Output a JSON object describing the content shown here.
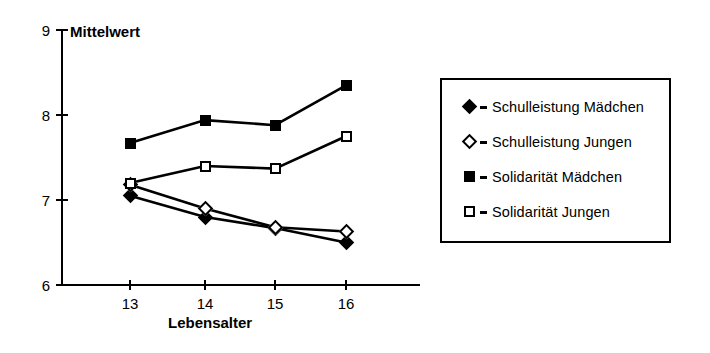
{
  "chart_data": {
    "type": "line",
    "title": "",
    "xlabel": "Lebensalter",
    "ylabel": "Mittelwert",
    "categories": [
      "13",
      "14",
      "15",
      "16"
    ],
    "x": [
      13,
      14,
      15,
      16
    ],
    "ylim": [
      6,
      9
    ],
    "yticks": [
      "6",
      "7",
      "8",
      "9"
    ],
    "xticks": [
      "13",
      "14",
      "15",
      "16"
    ],
    "grid": false,
    "legend_position": "right",
    "series": [
      {
        "name": "Schulleistung Mädchen",
        "marker": "filled-diamond",
        "values": [
          7.05,
          6.8,
          6.67,
          6.5
        ]
      },
      {
        "name": "Schulleistung Jungen",
        "marker": "open-diamond",
        "values": [
          7.18,
          6.9,
          6.68,
          6.63
        ]
      },
      {
        "name": "Solidarität Mädchen",
        "marker": "filled-square",
        "values": [
          7.67,
          7.94,
          7.88,
          8.35
        ]
      },
      {
        "name": "Solidarität Jungen",
        "marker": "open-square",
        "values": [
          7.2,
          7.4,
          7.37,
          7.75
        ]
      }
    ]
  },
  "axes": {
    "y_title": "Mittelwert",
    "x_title": "Lebensalter",
    "y_tick_labels": [
      "9",
      "8",
      "7",
      "6"
    ],
    "x_tick_labels": [
      "13",
      "14",
      "15",
      "16"
    ]
  },
  "legend": {
    "entries": [
      {
        "label": "Schulleistung Mädchen",
        "marker": "filled-diamond"
      },
      {
        "label": "Schulleistung Jungen",
        "marker": "open-diamond"
      },
      {
        "label": "Solidarität Mädchen",
        "marker": "filled-square"
      },
      {
        "label": "Solidarität Jungen",
        "marker": "open-square"
      }
    ]
  },
  "colors": {
    "ink": "#000000",
    "paper": "#ffffff"
  }
}
